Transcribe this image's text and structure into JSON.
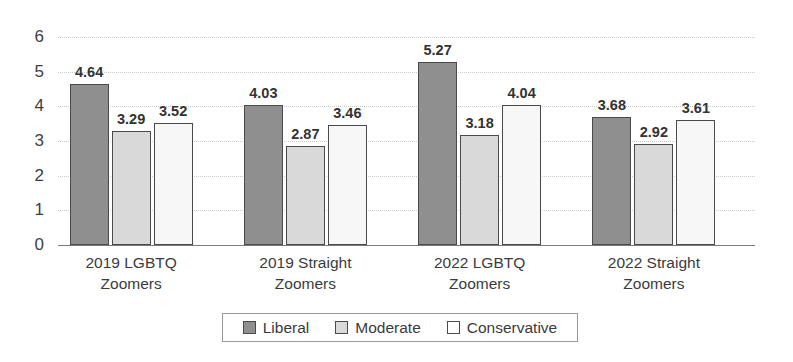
{
  "chart_data": {
    "type": "bar",
    "title": "",
    "subtitle": "",
    "xlabel": "",
    "ylabel": "",
    "ylim": [
      0,
      6
    ],
    "ytick_labels": [
      "0",
      "1",
      "2",
      "3",
      "4",
      "5",
      "6"
    ],
    "yticks": [
      0,
      1,
      2,
      3,
      4,
      5,
      6
    ],
    "grid": true,
    "legend_position": "bottom-center",
    "categories": [
      "2019 LGBTQ\nZoomers",
      "2019 Straight\nZoomers",
      "2022 LGBTQ\nZoomers",
      "2022 Straight\nZoomers"
    ],
    "category_lines": [
      [
        "2019 LGBTQ",
        "Zoomers"
      ],
      [
        "2019 Straight",
        "Zoomers"
      ],
      [
        "2022 LGBTQ",
        "Zoomers"
      ],
      [
        "2022 Straight",
        "Zoomers"
      ]
    ],
    "series": [
      {
        "name": "Liberal",
        "color": "#8f8f8f",
        "values": [
          4.64,
          4.03,
          5.27,
          3.68
        ],
        "labels": [
          "4.64",
          "4.03",
          "5.27",
          "3.68"
        ]
      },
      {
        "name": "Moderate",
        "color": "#d9d9d9",
        "values": [
          3.29,
          2.87,
          3.18,
          2.92
        ],
        "labels": [
          "3.29",
          "2.87",
          "3.18",
          "2.92"
        ]
      },
      {
        "name": "Conservative",
        "color": "#f7f7f7",
        "values": [
          3.52,
          3.46,
          4.04,
          3.61
        ],
        "labels": [
          "3.52",
          "3.46",
          "4.04",
          "3.61"
        ]
      }
    ]
  },
  "legend": {
    "items": [
      {
        "label": "Liberal",
        "swatch": "liberal-swatch"
      },
      {
        "label": "Moderate",
        "swatch": "moderate-swatch"
      },
      {
        "label": "Conservative",
        "swatch": "conservative-swatch"
      }
    ]
  },
  "colors": {
    "liberal": "#8f8f8f",
    "moderate": "#d9d9d9",
    "conservative": "#f7f7f7",
    "bar_border": "#4a4a4a",
    "gridline": "#c9c9c9",
    "axis": "#7a7a7a",
    "text": "#3b3b3b"
  }
}
